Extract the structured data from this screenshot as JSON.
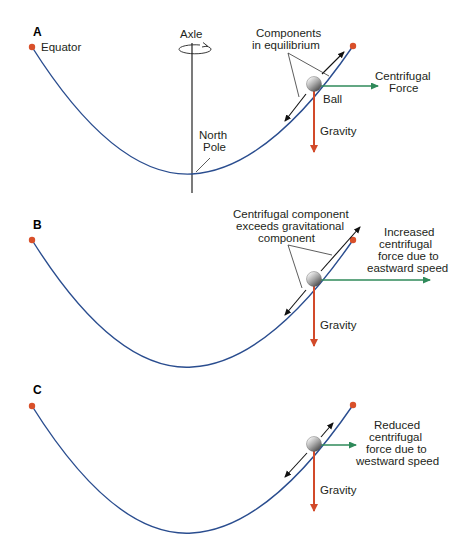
{
  "colors": {
    "curve": "#2a4d8f",
    "dot": "#d9502a",
    "gravity": "#d24a2a",
    "centrifugal": "#2f8a5a",
    "component": "#111111"
  },
  "panels": {
    "A": {
      "label": "A",
      "equator_label": "Equator",
      "axle_label": "Axle",
      "pole_label_1": "North",
      "pole_label_2": "Pole",
      "components_label_1": "Components",
      "components_label_2": "in equilibrium",
      "ball_label": "Ball",
      "centrifugal_label_1": "Centrifugal",
      "centrifugal_label_2": "Force",
      "gravity_label": "Gravity"
    },
    "B": {
      "label": "B",
      "components_label_1": "Centrifugal component",
      "components_label_2": "exceeds gravitational",
      "components_label_3": "component",
      "centrifugal_label_1": "Increased",
      "centrifugal_label_2": "centrifugal",
      "centrifugal_label_3": "force due to",
      "centrifugal_label_4": "eastward speed",
      "gravity_label": "Gravity"
    },
    "C": {
      "label": "C",
      "centrifugal_label_1": "Reduced",
      "centrifugal_label_2": "centrifugal",
      "centrifugal_label_3": "force due to",
      "centrifugal_label_4": "westward speed",
      "gravity_label": "Gravity"
    }
  }
}
